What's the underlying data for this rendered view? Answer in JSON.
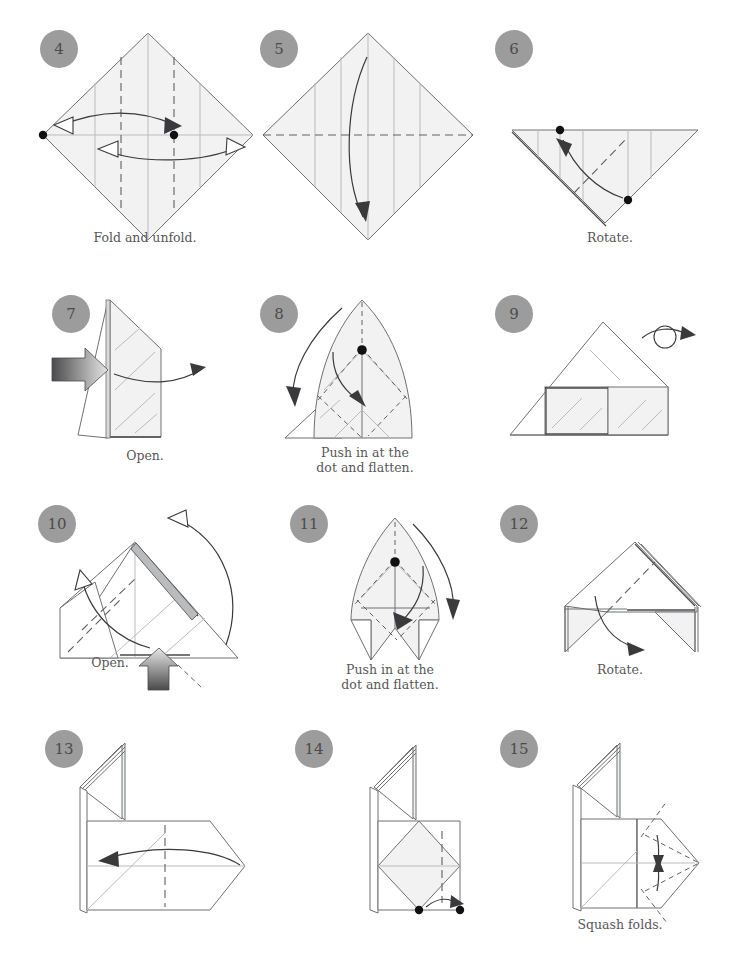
{
  "document": {
    "type": "origami-folding-instructions",
    "page_background": "#ffffff",
    "ink_color": "#58585a",
    "paper_fill": "#f2f2f2",
    "badge_fill": "#9c9c9c",
    "badge_text_color": "#4b4b4b"
  },
  "steps": [
    {
      "number": "4",
      "caption": "Fold and unfold.",
      "shape": "square-on-point (diamond)",
      "symbols": [
        "hollow-arrowhead-left",
        "hollow-arrowhead-right",
        "two-black-dots",
        "two-vertical-valley-creases"
      ]
    },
    {
      "number": "5",
      "caption": "",
      "shape": "square-on-point (diamond)",
      "symbols": [
        "horizontal-valley-crease",
        "long-curved-fold-arrow-down"
      ]
    },
    {
      "number": "6",
      "caption": "Rotate.",
      "shape": "downward-pointing-triangle",
      "symbols": [
        "black-dot-top",
        "black-dot-lower-right",
        "curved-arrow-up-left",
        "diagonal-valley-crease"
      ]
    },
    {
      "number": "7",
      "caption": "Open.",
      "shape": "upright-folded-flap",
      "symbols": [
        "gray-push-arrow-left",
        "curved-open-arrow-right"
      ]
    },
    {
      "number": "8",
      "caption": "Push in at the\ndot and flatten.",
      "shape": "pointed-hood",
      "symbols": [
        "black-dot-center",
        "curved-arrow-down-left",
        "curved-arrow-to-dot",
        "valley-creases"
      ]
    },
    {
      "number": "9",
      "caption": "",
      "shape": "house-triangle-on-rectangle",
      "symbols": [
        "turn-over-loop-arrow"
      ]
    },
    {
      "number": "10",
      "caption": "Open.",
      "shape": "wide-triangle",
      "symbols": [
        "gray-push-arrow-up",
        "curved-arrow-up-left-large",
        "curved-arrow-up-left-small",
        "valley-creases"
      ]
    },
    {
      "number": "11",
      "caption": "Push in at the\ndot and flatten.",
      "shape": "pointed-hood-with-legs",
      "symbols": [
        "black-dot-center",
        "curved-arrow-down-right",
        "curved-arrow-to-dot",
        "valley-creases"
      ]
    },
    {
      "number": "12",
      "caption": "Rotate.",
      "shape": "peaked-roof-with-flaps",
      "symbols": [
        "curved-rotate-arrow",
        "diagonal-valley-crease"
      ]
    },
    {
      "number": "13",
      "caption": "",
      "shape": "upright-flap-over-hexagon-body",
      "symbols": [
        "long-curved-arrow-left",
        "vertical-valley-crease"
      ]
    },
    {
      "number": "14",
      "caption": "",
      "shape": "upright-flap-over-square-with-diamond",
      "symbols": [
        "two-black-dots-bottom",
        "short-curved-arrow-right",
        "valley-crease"
      ]
    },
    {
      "number": "15",
      "caption": "Squash folds.",
      "shape": "upright-flap-over-square-with-point",
      "symbols": [
        "squash-fold-arrows",
        "dash-dot-creases",
        "valley-creases"
      ]
    }
  ]
}
